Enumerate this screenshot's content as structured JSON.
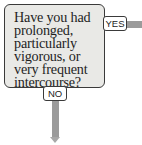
{
  "question": {
    "lines": [
      "Have you had",
      "prolonged,",
      "particularly",
      "vigorous, or",
      "very frequent",
      "intercourse?"
    ]
  },
  "branches": {
    "yes_label": "YES",
    "no_label": "NO"
  },
  "colors": {
    "box_fill": "#e9e9e6",
    "border": "#3a3a3a",
    "connector": "#9b9b9b"
  }
}
